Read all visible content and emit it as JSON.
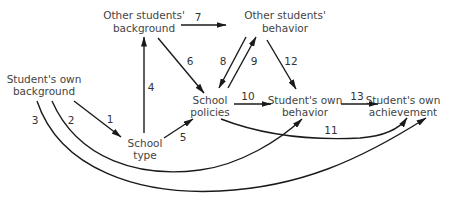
{
  "diagram": {
    "type": "path-diagram",
    "nodes": {
      "other_background": {
        "line1": "Other students'",
        "line2": "background"
      },
      "other_behavior": {
        "line1": "Other students'",
        "line2": "behavior"
      },
      "own_background": {
        "line1": "Student's own",
        "line2": "background"
      },
      "school_type": {
        "line1": "School",
        "line2": "type"
      },
      "school_policies": {
        "line1": "School",
        "line2": "policies"
      },
      "own_behavior": {
        "line1": "Student's own",
        "line2": "behavior"
      },
      "own_achievement": {
        "line1": "Student's own",
        "line2": "achievement"
      }
    },
    "edges": [
      {
        "id": "1",
        "label": "1",
        "from": "Student's own background",
        "to": "School type"
      },
      {
        "id": "2",
        "label": "2",
        "from": "Student's own background",
        "to": "Student's own behavior"
      },
      {
        "id": "3",
        "label": "3",
        "from": "Student's own background",
        "to": "Student's own achievement"
      },
      {
        "id": "4",
        "label": "4",
        "from": "School type",
        "to": "Other students' background"
      },
      {
        "id": "5",
        "label": "5",
        "from": "School type",
        "to": "School policies"
      },
      {
        "id": "6",
        "label": "6",
        "from": "Other students' background",
        "to": "School policies"
      },
      {
        "id": "7",
        "label": "7",
        "from": "Other students' background",
        "to": "Other students' behavior"
      },
      {
        "id": "8",
        "label": "8",
        "from": "Other students' behavior",
        "to": "School policies"
      },
      {
        "id": "9",
        "label": "9",
        "from": "School policies",
        "to": "Other students' behavior"
      },
      {
        "id": "10",
        "label": "10",
        "from": "School policies",
        "to": "Student's own behavior"
      },
      {
        "id": "11",
        "label": "11",
        "from": "School policies",
        "to": "Student's own achievement"
      },
      {
        "id": "12",
        "label": "12",
        "from": "Other students' behavior",
        "to": "Student's own behavior"
      },
      {
        "id": "13",
        "label": "13",
        "from": "Student's own behavior",
        "to": "Student's own achievement"
      }
    ],
    "colors": {
      "line": "#1a1a1a",
      "text": "#444444",
      "background": "#ffffff"
    }
  }
}
